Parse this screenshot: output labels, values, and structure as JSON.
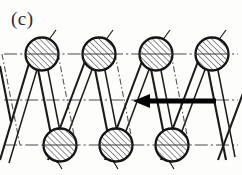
{
  "figure": {
    "panel_label": "(c)",
    "caption_alt": "Helical coil winding cross-section diagram",
    "colors": {
      "ink": "#1a1a1a",
      "centerline": "#4a4a4a",
      "hatch": "#2a2a2a",
      "background": "#fdfdfc",
      "arrow": "#000000"
    },
    "geometry": {
      "width": 242,
      "height": 175,
      "circle_radius": 16.5,
      "hatch_angle_deg": 45,
      "hatch_spacing": 4.2
    },
    "centerlines": [
      {
        "name": "top-centerline",
        "y": 54,
        "x1": 4,
        "x2": 238
      },
      {
        "name": "middle-centerline",
        "y": 100,
        "x1": 4,
        "x2": 238
      },
      {
        "name": "bottom-centerline",
        "y": 145,
        "x1": 4,
        "x2": 238
      }
    ],
    "top_circles": [
      {
        "cx": 42,
        "cy": 54
      },
      {
        "cx": 99,
        "cy": 54
      },
      {
        "cx": 156,
        "cy": 54
      },
      {
        "cx": 212,
        "cy": 54
      }
    ],
    "bottom_circles": [
      {
        "cx": 60,
        "cy": 145
      },
      {
        "cx": 116,
        "cy": 145
      },
      {
        "cx": 172,
        "cy": 145
      }
    ],
    "coil_strands": [
      {
        "name": "strand-down-1",
        "x_top": 42,
        "x_bottom": 60,
        "style": "solid"
      },
      {
        "name": "strand-down-2",
        "x_top": 99,
        "x_bottom": 116,
        "style": "solid"
      },
      {
        "name": "strand-down-3",
        "x_top": 156,
        "x_bottom": 172,
        "style": "solid"
      },
      {
        "name": "strand-down-4",
        "x_top": 212,
        "x_bottom": 229,
        "style": "solid"
      },
      {
        "name": "strand-up-1",
        "x_bottom": 60,
        "x_top": 99,
        "style": "solid"
      },
      {
        "name": "strand-up-2",
        "x_bottom": 116,
        "x_top": 156,
        "style": "solid"
      },
      {
        "name": "strand-up-3",
        "x_bottom": 172,
        "x_top": 212,
        "style": "solid"
      },
      {
        "name": "strand-up-0",
        "x_bottom": 4,
        "x_top": 42,
        "style": "solid"
      }
    ],
    "hidden_strands": [
      {
        "name": "hidden-strand-1",
        "x_top": 58,
        "x_bottom": 76
      },
      {
        "name": "hidden-strand-2",
        "x_top": 115,
        "x_bottom": 132
      },
      {
        "name": "hidden-strand-3",
        "x_top": 171,
        "x_bottom": 188
      }
    ],
    "arrow": {
      "name": "direction-arrow",
      "direction": "left",
      "tip_x": 133,
      "tail_x": 216,
      "y": 101,
      "shaft_thickness": 5,
      "head_length": 15,
      "head_width": 13
    }
  }
}
